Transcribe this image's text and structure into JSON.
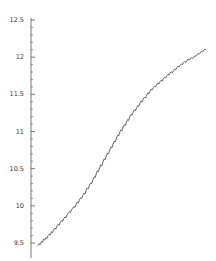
{
  "chart_data": {
    "type": "line",
    "title": "",
    "xlabel": "",
    "ylabel": "",
    "ylim": [
      9.4,
      12.55
    ],
    "xlim": [
      0,
      300
    ],
    "grid": false,
    "legend": null,
    "y_major_ticks": [
      9.5,
      10,
      10.5,
      11,
      11.5,
      12,
      12.5
    ],
    "y_tick_labels": [
      "9.5",
      "10",
      "10.5",
      "11",
      "11.5",
      "12",
      "12.5"
    ],
    "y_minor_ticks": [
      9.6,
      9.7,
      9.8,
      9.9,
      10.1,
      10.2,
      10.3,
      10.4,
      10.6,
      10.7,
      10.8,
      10.9,
      11.1,
      11.2,
      11.3,
      11.4,
      11.6,
      11.7,
      11.8,
      11.9,
      12.1,
      12.2,
      12.3,
      12.4
    ],
    "axis_color": "#555555",
    "line_color": "#3c3c3c",
    "series": [
      {
        "name": "series-1",
        "x": [
          0,
          2,
          4,
          6,
          8,
          10,
          12,
          14,
          16,
          18,
          20,
          22,
          24,
          26,
          28,
          30,
          32,
          34,
          36,
          38,
          40,
          42,
          44,
          46,
          48,
          50,
          52,
          54,
          56,
          58,
          60,
          62,
          64,
          66,
          68,
          70,
          72,
          74,
          76,
          78,
          80,
          82,
          84,
          86,
          88,
          90,
          92,
          94,
          96,
          98,
          100,
          102,
          104,
          106,
          108,
          110,
          112,
          114,
          116,
          118,
          120,
          122,
          124,
          126,
          128,
          130,
          132,
          134,
          136,
          138,
          140,
          142,
          144,
          146,
          148,
          150,
          152,
          154,
          156,
          158,
          160,
          162,
          164,
          166,
          168,
          170,
          172,
          174,
          176,
          178,
          180,
          182,
          184,
          186,
          188,
          190,
          192,
          194,
          196,
          198,
          200,
          202,
          204,
          206,
          208,
          210,
          212,
          214,
          216,
          218,
          220,
          222,
          224,
          226,
          228,
          230,
          232,
          234,
          236,
          238,
          240,
          242,
          244,
          246,
          248,
          250,
          252,
          254,
          256,
          258,
          260,
          262,
          264,
          266,
          268,
          270,
          272,
          274,
          276,
          278,
          280,
          282,
          284,
          286,
          288,
          290,
          292,
          294,
          296,
          298,
          300
        ],
        "y": [
          9.47,
          9.49,
          9.48,
          9.52,
          9.51,
          9.55,
          9.54,
          9.57,
          9.56,
          9.6,
          9.62,
          9.61,
          9.65,
          9.64,
          9.68,
          9.7,
          9.69,
          9.73,
          9.75,
          9.74,
          9.78,
          9.8,
          9.79,
          9.83,
          9.85,
          9.84,
          9.88,
          9.9,
          9.92,
          9.91,
          9.95,
          9.97,
          9.99,
          9.98,
          10.02,
          10.05,
          10.04,
          10.08,
          10.11,
          10.1,
          10.14,
          10.17,
          10.16,
          10.21,
          10.24,
          10.23,
          10.28,
          10.31,
          10.3,
          10.35,
          10.39,
          10.38,
          10.43,
          10.47,
          10.46,
          10.51,
          10.55,
          10.54,
          10.59,
          10.63,
          10.62,
          10.67,
          10.71,
          10.7,
          10.75,
          10.79,
          10.78,
          10.83,
          10.87,
          10.86,
          10.91,
          10.95,
          10.94,
          10.99,
          11.02,
          11.01,
          11.06,
          11.09,
          11.08,
          11.13,
          11.16,
          11.15,
          11.2,
          11.23,
          11.22,
          11.26,
          11.29,
          11.28,
          11.32,
          11.35,
          11.34,
          11.38,
          11.41,
          11.4,
          11.44,
          11.46,
          11.45,
          11.49,
          11.52,
          11.51,
          11.54,
          11.57,
          11.56,
          11.59,
          11.61,
          11.6,
          11.63,
          11.65,
          11.64,
          11.67,
          11.69,
          11.68,
          11.71,
          11.73,
          11.72,
          11.75,
          11.77,
          11.76,
          11.79,
          11.8,
          11.79,
          11.82,
          11.84,
          11.83,
          11.86,
          11.88,
          11.87,
          11.89,
          11.91,
          11.9,
          11.93,
          11.94,
          11.93,
          11.96,
          11.97,
          11.96,
          11.98,
          11.99,
          11.98,
          12.0,
          12.02,
          12.01,
          12.03,
          12.05,
          12.04,
          12.06,
          12.08,
          12.07,
          12.09,
          12.11,
          12.1
        ]
      }
    ]
  },
  "axis": {
    "line_x_px": 31,
    "top_y_px": 20,
    "bottom_y_px": 258
  }
}
